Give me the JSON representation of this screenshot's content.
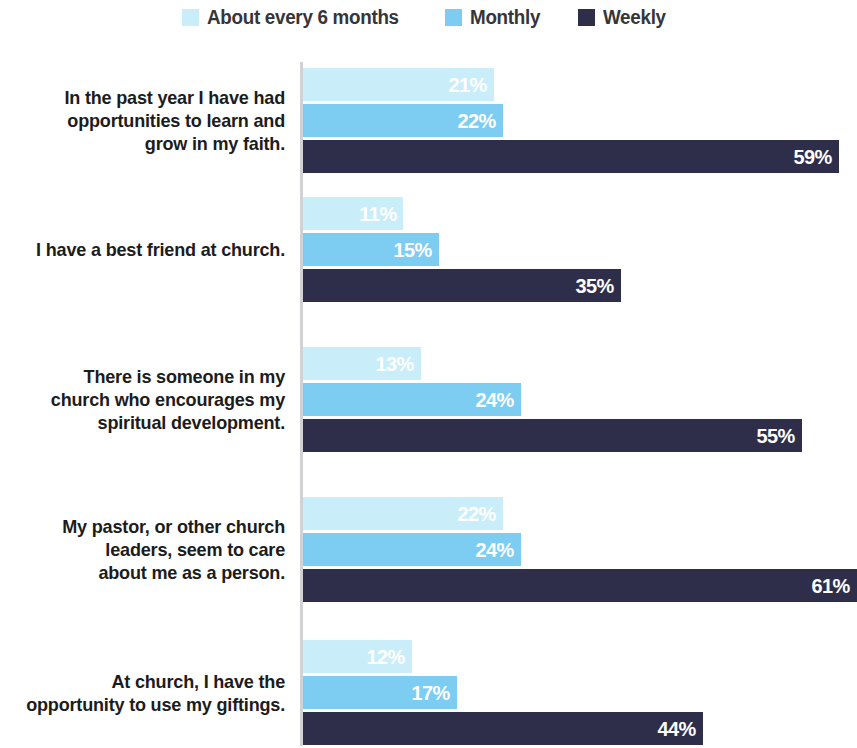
{
  "legend": {
    "items": [
      {
        "label": "About every 6 months",
        "color": "#c9eef9"
      },
      {
        "label": "Monthly",
        "color": "#7dcdf3"
      },
      {
        "label": "Weekly",
        "color": "#2e2e4a"
      }
    ]
  },
  "axis": {
    "line_color": "#d2d2d4"
  },
  "chart_data": {
    "type": "bar",
    "orientation": "horizontal",
    "grouped": true,
    "title": "",
    "subtitle": "",
    "xlabel": "",
    "ylabel": "",
    "xlim": [
      0,
      61
    ],
    "grid": false,
    "legend_position": "top",
    "value_suffix": "%",
    "categories": [
      "In the past year I have had opportunities to learn and grow in my faith.",
      "I have a best friend at church.",
      "There is someone in my church who encourages my spiritual development.",
      "My pastor, or other church leaders, seem to care about me as a person.",
      "At church, I have the opportunity to use my giftings."
    ],
    "series": [
      {
        "name": "About every 6 months",
        "color": "#c9eef9",
        "values": [
          21,
          11,
          13,
          22,
          12
        ],
        "labels": [
          "21%",
          "11%",
          "13%",
          "22%",
          "12%"
        ]
      },
      {
        "name": "Monthly",
        "color": "#7dcdf3",
        "values": [
          22,
          15,
          24,
          24,
          17
        ],
        "labels": [
          "22%",
          "15%",
          "24%",
          "24%",
          "17%"
        ]
      },
      {
        "name": "Weekly",
        "color": "#2e2e4a",
        "values": [
          59,
          35,
          55,
          61,
          44
        ],
        "labels": [
          "59%",
          "35%",
          "55%",
          "61%",
          "44%"
        ]
      }
    ],
    "groups": [
      {
        "label": "In the past year I have had opportunities to learn and grow in my faith.",
        "label_lines": [
          "In the past year I have had",
          "opportunities to learn and",
          "grow in my faith."
        ],
        "bars": [
          {
            "series": "About every 6 months",
            "value": 21,
            "label": "21%",
            "color": "#c9eef9"
          },
          {
            "series": "Monthly",
            "value": 22,
            "label": "22%",
            "color": "#7dcdf3"
          },
          {
            "series": "Weekly",
            "value": 59,
            "label": "59%",
            "color": "#2e2e4a"
          }
        ]
      },
      {
        "label": "I have a best friend at church.",
        "label_lines": [
          "I have a best friend at church."
        ],
        "bars": [
          {
            "series": "About every 6 months",
            "value": 11,
            "label": "11%",
            "color": "#c9eef9"
          },
          {
            "series": "Monthly",
            "value": 15,
            "label": "15%",
            "color": "#7dcdf3"
          },
          {
            "series": "Weekly",
            "value": 35,
            "label": "35%",
            "color": "#2e2e4a"
          }
        ]
      },
      {
        "label": "There is someone in my church who encourages my spiritual development.",
        "label_lines": [
          "There is someone in my",
          "church who encourages my",
          "spiritual development."
        ],
        "bars": [
          {
            "series": "About every 6 months",
            "value": 13,
            "label": "13%",
            "color": "#c9eef9"
          },
          {
            "series": "Monthly",
            "value": 24,
            "label": "24%",
            "color": "#7dcdf3"
          },
          {
            "series": "Weekly",
            "value": 55,
            "label": "55%",
            "color": "#2e2e4a"
          }
        ]
      },
      {
        "label": "My pastor, or other church leaders, seem to care about me as a person.",
        "label_lines": [
          "My pastor, or other church",
          "leaders, seem to care",
          "about me as a person."
        ],
        "bars": [
          {
            "series": "About every 6 months",
            "value": 22,
            "label": "22%",
            "color": "#c9eef9"
          },
          {
            "series": "Monthly",
            "value": 24,
            "label": "24%",
            "color": "#7dcdf3"
          },
          {
            "series": "Weekly",
            "value": 61,
            "label": "61%",
            "color": "#2e2e4a"
          }
        ]
      },
      {
        "label": "At church, I have the opportunity to use my giftings.",
        "label_lines": [
          "At church, I have the",
          "opportunity to use my giftings."
        ],
        "bars": [
          {
            "series": "About every 6 months",
            "value": 12,
            "label": "12%",
            "color": "#c9eef9"
          },
          {
            "series": "Monthly",
            "value": 17,
            "label": "17%",
            "color": "#7dcdf3"
          },
          {
            "series": "Weekly",
            "value": 44,
            "label": "44%",
            "color": "#2e2e4a"
          }
        ]
      }
    ]
  },
  "layout": {
    "px_per_percent": 9.08,
    "bar_height": 33,
    "bar_gap": 3,
    "group_tops": [
      12,
      141,
      291,
      441,
      584
    ]
  }
}
